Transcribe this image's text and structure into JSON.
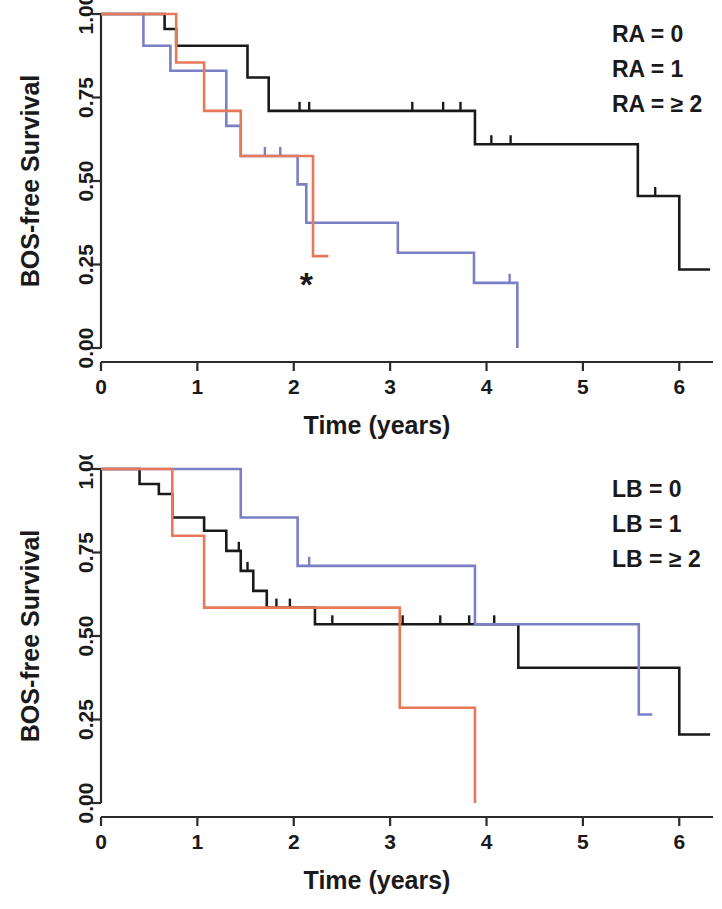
{
  "figure": {
    "panels": [
      {
        "id": "top",
        "legend": [
          {
            "label": "RA = 0",
            "color": "#1a1a1a"
          },
          {
            "label": "RA = 1",
            "color": "#7b7fc4"
          },
          {
            "label": "RA = ≥ 2",
            "color": "#e8785a"
          }
        ],
        "annotation": "*"
      },
      {
        "id": "bottom",
        "legend": [
          {
            "label": "LB = 0",
            "color": "#1a1a1a"
          },
          {
            "label": "LB = 1",
            "color": "#7b7fc4"
          },
          {
            "label": "LB = ≥ 2",
            "color": "#e8785a"
          }
        ],
        "annotation": ""
      }
    ]
  },
  "chart_data": [
    {
      "type": "line",
      "subtype": "kaplan-meier-step",
      "title": "",
      "xlabel": "Time (years)",
      "ylabel": "BOS-free Survival",
      "xlim": [
        0,
        6.35
      ],
      "ylim": [
        0,
        1
      ],
      "xticks": [
        0,
        1,
        2,
        3,
        4,
        5,
        6
      ],
      "xticklabels": [
        "0",
        "1",
        "2",
        "3",
        "4",
        "5",
        "6"
      ],
      "yticks": [
        0,
        0.25,
        0.5,
        0.75,
        1
      ],
      "yticklabels": [
        "0.00",
        "0.25",
        "0.50",
        "0.75",
        "1.00"
      ],
      "grid": false,
      "legend_position": "top-right",
      "series": [
        {
          "name": "RA = 0",
          "color": "#1a1a1a",
          "points": [
            [
              0.0,
              1.0
            ],
            [
              0.66,
              1.0
            ],
            [
              0.66,
              0.955
            ],
            [
              0.78,
              0.955
            ],
            [
              0.78,
              0.905
            ],
            [
              1.52,
              0.905
            ],
            [
              1.52,
              0.81
            ],
            [
              1.74,
              0.81
            ],
            [
              1.74,
              0.71
            ],
            [
              3.88,
              0.71
            ],
            [
              3.88,
              0.61
            ],
            [
              5.57,
              0.61
            ],
            [
              5.57,
              0.455
            ],
            [
              6.0,
              0.455
            ],
            [
              6.0,
              0.235
            ],
            [
              6.32,
              0.235
            ]
          ],
          "censored": [
            2.06,
            2.16,
            3.23,
            3.55,
            3.73,
            4.05,
            4.25,
            5.75
          ]
        },
        {
          "name": "RA = 1",
          "color": "#7b7fc4",
          "points": [
            [
              0.0,
              1.0
            ],
            [
              0.44,
              1.0
            ],
            [
              0.44,
              0.905
            ],
            [
              0.72,
              0.905
            ],
            [
              0.72,
              0.83
            ],
            [
              1.3,
              0.83
            ],
            [
              1.3,
              0.665
            ],
            [
              1.45,
              0.665
            ],
            [
              1.45,
              0.575
            ],
            [
              2.04,
              0.575
            ],
            [
              2.04,
              0.49
            ],
            [
              2.13,
              0.49
            ],
            [
              2.13,
              0.375
            ],
            [
              3.08,
              0.375
            ],
            [
              3.08,
              0.285
            ],
            [
              3.87,
              0.285
            ],
            [
              3.87,
              0.195
            ],
            [
              4.32,
              0.195
            ],
            [
              4.32,
              0.0
            ]
          ],
          "censored": [
            1.7,
            1.86,
            4.24
          ]
        },
        {
          "name": "RA = ≥ 2",
          "color": "#e8785a",
          "points": [
            [
              0.0,
              1.0
            ],
            [
              0.78,
              1.0
            ],
            [
              0.78,
              0.855
            ],
            [
              1.07,
              0.855
            ],
            [
              1.07,
              0.71
            ],
            [
              1.45,
              0.71
            ],
            [
              1.45,
              0.575
            ],
            [
              2.2,
              0.575
            ],
            [
              2.2,
              0.275
            ],
            [
              2.36,
              0.275
            ]
          ],
          "censored": []
        }
      ],
      "annotations": [
        {
          "text": "*",
          "x": 2.13,
          "y": 0.155
        }
      ]
    },
    {
      "type": "line",
      "subtype": "kaplan-meier-step",
      "title": "",
      "xlabel": "Time (years)",
      "ylabel": "BOS-free Survival",
      "xlim": [
        0,
        6.35
      ],
      "ylim": [
        0,
        1
      ],
      "xticks": [
        0,
        1,
        2,
        3,
        4,
        5,
        6
      ],
      "xticklabels": [
        "0",
        "1",
        "2",
        "3",
        "4",
        "5",
        "6"
      ],
      "yticks": [
        0,
        0.25,
        0.5,
        0.75,
        1
      ],
      "yticklabels": [
        "0.00",
        "0.25",
        "0.50",
        "0.75",
        "1.00"
      ],
      "grid": false,
      "legend_position": "top-right",
      "series": [
        {
          "name": "LB = 0",
          "color": "#1a1a1a",
          "points": [
            [
              0.0,
              1.0
            ],
            [
              0.4,
              1.0
            ],
            [
              0.4,
              0.955
            ],
            [
              0.6,
              0.955
            ],
            [
              0.6,
              0.925
            ],
            [
              0.74,
              0.925
            ],
            [
              0.74,
              0.855
            ],
            [
              1.07,
              0.855
            ],
            [
              1.07,
              0.815
            ],
            [
              1.3,
              0.815
            ],
            [
              1.3,
              0.755
            ],
            [
              1.45,
              0.755
            ],
            [
              1.45,
              0.695
            ],
            [
              1.58,
              0.695
            ],
            [
              1.58,
              0.635
            ],
            [
              1.72,
              0.635
            ],
            [
              1.72,
              0.585
            ],
            [
              2.22,
              0.585
            ],
            [
              2.22,
              0.535
            ],
            [
              4.33,
              0.535
            ],
            [
              4.33,
              0.405
            ],
            [
              6.0,
              0.405
            ],
            [
              6.0,
              0.205
            ],
            [
              6.32,
              0.205
            ]
          ],
          "censored": [
            1.43,
            1.52,
            1.82,
            1.96,
            2.4,
            3.13,
            3.52,
            3.82,
            4.08
          ]
        },
        {
          "name": "LB = 1",
          "color": "#7b7fc4",
          "points": [
            [
              0.0,
              1.0
            ],
            [
              1.45,
              1.0
            ],
            [
              1.45,
              0.855
            ],
            [
              2.04,
              0.855
            ],
            [
              2.04,
              0.71
            ],
            [
              3.88,
              0.71
            ],
            [
              3.88,
              0.535
            ],
            [
              5.58,
              0.535
            ],
            [
              5.58,
              0.265
            ],
            [
              5.72,
              0.265
            ]
          ],
          "censored": [
            2.16
          ]
        },
        {
          "name": "LB = ≥ 2",
          "color": "#e8785a",
          "points": [
            [
              0.0,
              1.0
            ],
            [
              0.74,
              1.0
            ],
            [
              0.74,
              0.8
            ],
            [
              1.07,
              0.8
            ],
            [
              1.07,
              0.585
            ],
            [
              3.1,
              0.585
            ],
            [
              3.1,
              0.285
            ],
            [
              3.88,
              0.285
            ],
            [
              3.88,
              0.0
            ]
          ],
          "censored": []
        }
      ],
      "annotations": []
    }
  ]
}
